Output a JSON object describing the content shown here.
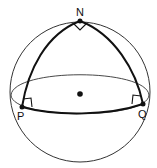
{
  "diagram": {
    "type": "spherical-triangle-on-sphere",
    "points": {
      "N": {
        "label": "N",
        "x": 80,
        "y": 21
      },
      "P": {
        "label": "P",
        "x": 22,
        "y": 107
      },
      "Q": {
        "label": "Q",
        "x": 143,
        "y": 104
      }
    },
    "center_dot": {
      "x": 80,
      "y": 94
    },
    "right_angle_markers": [
      "N",
      "P",
      "Q"
    ],
    "colors": {
      "stroke": "#111111",
      "thin_stroke": "#333333",
      "background": "#ffffff"
    }
  }
}
